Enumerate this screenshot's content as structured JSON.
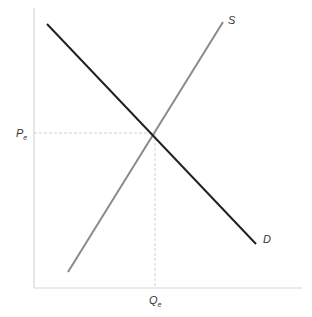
{
  "diagram": {
    "type": "supply-demand",
    "curves": {
      "supply": {
        "label": "S",
        "color": "#8a8a8a"
      },
      "demand": {
        "label": "D",
        "color": "#222222"
      }
    },
    "equilibrium": {
      "price_label": "P",
      "price_subscript": "e",
      "quantity_label": "Q",
      "quantity_subscript": "e"
    },
    "colors": {
      "axis": "#d8d8d8",
      "guide": "#d0d0d0"
    }
  }
}
